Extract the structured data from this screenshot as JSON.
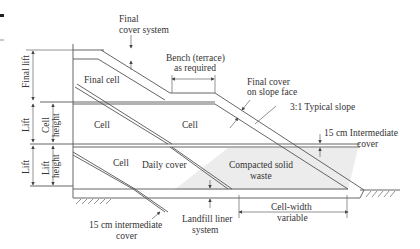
{
  "diagram": {
    "labels": {
      "final_cover_system_1": "Final",
      "final_cover_system_2": "cover system",
      "bench_1": "Bench (terrace)",
      "bench_2": "as required",
      "final_cover_slope_1": "Final cover",
      "final_cover_slope_2": "on slope face",
      "typical_slope": "3:1 Typical slope",
      "intermediate_cover_right_1": "15 cm Intermediate",
      "intermediate_cover_right_2": "cover",
      "final_cell": "Final cell",
      "cell_1": "Cell",
      "cell_2": "Cell",
      "cell_3": "Cell",
      "daily_cover": "Daily cover",
      "compacted_waste_1": "Compacted solid",
      "compacted_waste_2": "waste",
      "intermediate_cover_left_1": "15 cm intermediate",
      "intermediate_cover_left_2": "cover",
      "liner_1": "Landfill liner",
      "liner_2": "system",
      "cell_width_1": "Cell-width",
      "cell_width_2": "variable",
      "final_lift": "Final lift",
      "lift_1": "Lift",
      "lift_2": "Lift",
      "cell_height_1": "Cell",
      "cell_height_2": "height",
      "lift_height_1": "Lift",
      "lift_height_2": "height"
    },
    "colors": {
      "line": "#555555",
      "waste_fill": "#ececec",
      "text": "#333333"
    }
  }
}
